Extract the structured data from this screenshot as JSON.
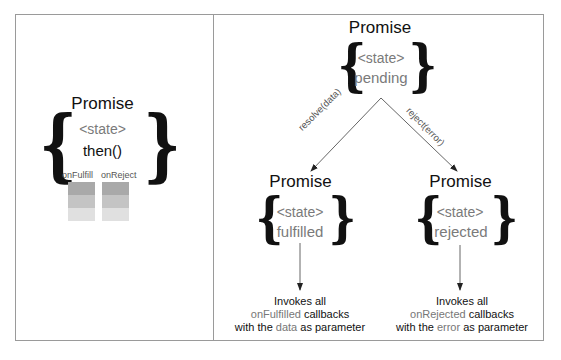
{
  "left_panel": {
    "title": "Promise",
    "state_label": "<state>",
    "method": "then()",
    "queues": [
      {
        "label": "onFulfill",
        "rows": [
          "#a9a9a9",
          "#c4c4c4",
          "#e0e0e0"
        ]
      },
      {
        "label": "onReject",
        "rows": [
          "#a9a9a9",
          "#c4c4c4",
          "#e0e0e0"
        ]
      }
    ]
  },
  "right_panel": {
    "pending": {
      "title": "Promise",
      "state_label": "<state>",
      "value": "pending"
    },
    "edges": {
      "resolve": "resolve(data)",
      "reject": "reject(error)"
    },
    "fulfilled": {
      "title": "Promise",
      "state_label": "<state>",
      "value": "fulfilled",
      "caption": {
        "line1": "Invokes all",
        "line2_hl": "onFulfilled",
        "line2_rest": " callbacks",
        "line3_a": "with the ",
        "line3_hl": "data",
        "line3_b": " as parameter"
      }
    },
    "rejected": {
      "title": "Promise",
      "state_label": "<state>",
      "value": "rejected",
      "caption": {
        "line1": "Invokes all",
        "line2_hl": "onRejected",
        "line2_rest": " callbacks",
        "line3_a": "with the ",
        "line3_hl": "error",
        "line3_b": " as parameter"
      }
    }
  }
}
